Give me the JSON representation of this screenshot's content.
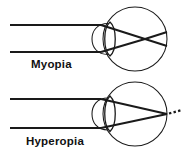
{
  "figure": {
    "background_color": "#ffffff",
    "stroke_color": "#1a1a1a",
    "width": 182,
    "height": 157
  },
  "panels": [
    {
      "id": "myopia",
      "label": "Myopia",
      "label_position": {
        "x": 31,
        "y": 68
      },
      "description": "Parallel light rays focus in front of the retina",
      "eyeball": {
        "cx": 135,
        "cy": 39,
        "r": 32
      },
      "cornea": {
        "cx": 101,
        "cy": 39,
        "rx": 12,
        "ry": 17,
        "description": "cornea arc at front of eye"
      },
      "lens": {
        "cx": 110,
        "cy": 39,
        "half_width": 7,
        "half_height": 17,
        "description": "biconvex crystalline lens"
      },
      "incoming_rays": [
        {
          "x1": 10,
          "y1": 25,
          "x2": 101,
          "y2": 25
        },
        {
          "x1": 10,
          "y1": 52,
          "x2": 101,
          "y2": 52
        }
      ],
      "refracted_rays": [
        {
          "x1": 101,
          "y1": 25,
          "x2": 145,
          "y2": 39,
          "x3": 167,
          "y3": 46
        },
        {
          "x1": 101,
          "y1": 52,
          "x2": 145,
          "y2": 39,
          "x3": 167,
          "y3": 32
        }
      ],
      "focal_point": {
        "x": 145,
        "y": 39,
        "inside_eye": true
      },
      "dashed_extension": null
    },
    {
      "id": "hyperopia",
      "label": "Hyperopia",
      "label_position": {
        "x": 26,
        "y": 145
      },
      "description": "Parallel light rays focus behind the retina",
      "eyeball": {
        "cx": 135,
        "cy": 114,
        "r": 32
      },
      "cornea": {
        "cx": 101,
        "cy": 114,
        "rx": 12,
        "ry": 17,
        "description": "cornea arc at front of eye"
      },
      "lens": {
        "cx": 110,
        "cy": 114,
        "half_width": 7,
        "half_height": 17,
        "description": "biconvex crystalline lens"
      },
      "incoming_rays": [
        {
          "x1": 10,
          "y1": 99,
          "x2": 101,
          "y2": 99
        },
        {
          "x1": 10,
          "y1": 128,
          "x2": 101,
          "y2": 128
        }
      ],
      "refracted_rays": [
        {
          "x1": 101,
          "y1": 99,
          "x2": 167,
          "y2": 114
        },
        {
          "x1": 101,
          "y1": 128,
          "x2": 167,
          "y2": 114
        }
      ],
      "focal_point": {
        "x": 181,
        "y": 114,
        "inside_eye": false
      },
      "dashed_extension": {
        "x1": 168,
        "y1": 113,
        "x2": 182,
        "y2": 110,
        "dash_count": 4,
        "description": "dashed rays continuing behind the eye to the focal point"
      }
    }
  ]
}
